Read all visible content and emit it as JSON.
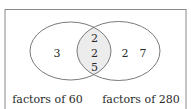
{
  "diagram": {
    "type": "venn",
    "sets": [
      {
        "label": "factors of 60",
        "only": [
          "3"
        ]
      },
      {
        "label": "factors of 280",
        "only": [
          "2",
          "7"
        ]
      }
    ],
    "intersection": [
      "2",
      "2",
      "5"
    ],
    "colors": {
      "outline": "#7a7a7a",
      "intersection_fill": "#ececec",
      "text": "#2a2a2a",
      "frame": "#8a8a8a"
    }
  }
}
